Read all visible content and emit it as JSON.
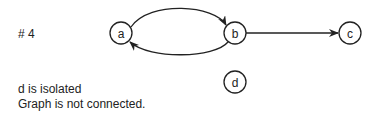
{
  "diagram": {
    "title": "# 4",
    "nodes": [
      {
        "id": "a",
        "label": "a",
        "x": 121,
        "y": 33
      },
      {
        "id": "b",
        "label": "b",
        "x": 235,
        "y": 33
      },
      {
        "id": "c",
        "label": "c",
        "x": 350,
        "y": 33
      },
      {
        "id": "d",
        "label": "d",
        "x": 235,
        "y": 82
      }
    ],
    "edges": [
      {
        "from": "a",
        "to": "b",
        "style": "curved-upper"
      },
      {
        "from": "b",
        "to": "a",
        "style": "curved-lower"
      },
      {
        "from": "b",
        "to": "c",
        "style": "straight"
      }
    ],
    "notes": [
      "d is isolated",
      "Graph is not connected."
    ]
  }
}
